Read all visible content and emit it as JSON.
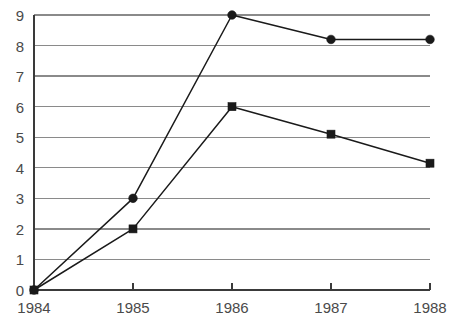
{
  "chart_data": {
    "type": "line",
    "title": "",
    "subtitle": "",
    "xlabel": "",
    "ylabel": "",
    "categories": [
      "1984",
      "1985",
      "1986",
      "1987",
      "1988"
    ],
    "x": [
      1984,
      1985,
      1986,
      1987,
      1988
    ],
    "series": [
      {
        "name": "series-1",
        "marker": "circle",
        "color": "#1a1a1a",
        "values": [
          0,
          3,
          9,
          8.2,
          8.2
        ]
      },
      {
        "name": "series-2",
        "marker": "square",
        "color": "#1a1a1a",
        "values": [
          0,
          2,
          6,
          5.1,
          4.15
        ]
      }
    ],
    "ylim": [
      0,
      9
    ],
    "xlim": [
      1984,
      1988
    ],
    "ytick_labels": [
      "0",
      "1",
      "2",
      "3",
      "4",
      "5",
      "6",
      "7",
      "8",
      "9"
    ],
    "ytick_values": [
      0,
      1,
      2,
      3,
      4,
      5,
      6,
      7,
      8,
      9
    ],
    "xtick_labels": [
      "1984",
      "1985",
      "1986",
      "1987",
      "1988"
    ],
    "grid": "horizontal",
    "legend": "none",
    "annotations": []
  },
  "style": {
    "background_color": "#ffffff",
    "gridline_color": "#8a8a8a",
    "axis_color": "#3a3a3a",
    "tick_label_color": "#4a4a4a",
    "series_line_color": "#1a1a1a"
  },
  "geometry": {
    "plot_left": 34,
    "plot_right": 430,
    "plot_top": 15,
    "plot_bottom": 290
  }
}
